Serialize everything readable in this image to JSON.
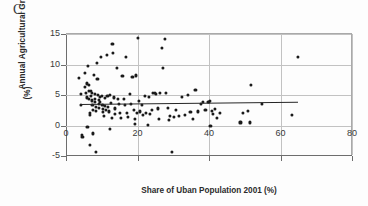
{
  "figure": {
    "panel_label": "C",
    "background_color": "#fdfdfd",
    "point_color": "#1a1a1a",
    "gridline_color": "#c2c2c2",
    "axis_color": "#6d6d6d",
    "trendline_color": "#262626"
  },
  "chart_data": {
    "type": "scatter",
    "title": "C",
    "xlabel": "Share of Uban Population 2001 (%)",
    "ylabel": "Annual Agricultural Growth (%)",
    "ylabel_line1": "Annual Agricultural Growth",
    "ylabel_line2": "(%)",
    "xlim": [
      0,
      80
    ],
    "ylim": [
      -5,
      15
    ],
    "xticks": [
      0,
      20,
      40,
      60,
      80
    ],
    "yticks": [
      -5,
      0,
      5,
      10,
      15
    ],
    "xtick_labels": [
      "0",
      "20",
      "40",
      "60",
      "80"
    ],
    "ytick_labels": [
      "-5",
      "0",
      "5",
      "10",
      "15"
    ],
    "grid": true,
    "grid_axis": "both",
    "legend": false,
    "legend_position": "none",
    "series": [
      {
        "name": "Countries",
        "marker": "circle",
        "color": "#1a1a1a",
        "points": [
          [
            3.6,
            7.8
          ],
          [
            4.2,
            5.1
          ],
          [
            4.3,
            3.4
          ],
          [
            4.4,
            -1.6
          ],
          [
            4.6,
            -1.9
          ],
          [
            5.2,
            8.6
          ],
          [
            5.4,
            6.3
          ],
          [
            5.6,
            5.4
          ],
          [
            5.8,
            4.6
          ],
          [
            5.9,
            6.9
          ],
          [
            6.0,
            -0.2
          ],
          [
            6.1,
            9.8
          ],
          [
            6.3,
            5.7
          ],
          [
            6.4,
            6.7
          ],
          [
            6.5,
            4.3
          ],
          [
            6.6,
            2.0
          ],
          [
            6.7,
            1.8
          ],
          [
            6.8,
            -3.2
          ],
          [
            7.0,
            5.6
          ],
          [
            7.1,
            4.9
          ],
          [
            7.2,
            5.3
          ],
          [
            7.3,
            4.1
          ],
          [
            7.4,
            3.3
          ],
          [
            7.5,
            2.6
          ],
          [
            7.6,
            -1.3
          ],
          [
            7.8,
            8.3
          ],
          [
            8.0,
            5.2
          ],
          [
            8.1,
            4.4
          ],
          [
            8.2,
            3.9
          ],
          [
            8.3,
            3.1
          ],
          [
            8.4,
            2.4
          ],
          [
            8.5,
            -4.3
          ],
          [
            8.7,
            10.2
          ],
          [
            8.8,
            7.6
          ],
          [
            9.0,
            5.0
          ],
          [
            9.1,
            4.2
          ],
          [
            9.2,
            3.6
          ],
          [
            9.3,
            2.9
          ],
          [
            9.5,
            4.7
          ],
          [
            9.6,
            3.8
          ],
          [
            9.8,
            11.2
          ],
          [
            10.0,
            4.9
          ],
          [
            10.2,
            3.4
          ],
          [
            10.3,
            2.7
          ],
          [
            10.4,
            2.2
          ],
          [
            10.6,
            1.5
          ],
          [
            10.8,
            4.5
          ],
          [
            11.0,
            3.2
          ],
          [
            11.2,
            2.5
          ],
          [
            11.4,
            11.5
          ],
          [
            11.6,
            4.8
          ],
          [
            11.8,
            3.0
          ],
          [
            12.0,
            2.3
          ],
          [
            12.2,
            -0.5
          ],
          [
            12.4,
            5.0
          ],
          [
            12.6,
            3.7
          ],
          [
            12.8,
            1.2
          ],
          [
            13.0,
            13.3
          ],
          [
            13.2,
            11.9
          ],
          [
            13.4,
            4.6
          ],
          [
            13.6,
            2.8
          ],
          [
            13.8,
            1.9
          ],
          [
            14.2,
            9.4
          ],
          [
            14.5,
            4.3
          ],
          [
            14.8,
            3.5
          ],
          [
            15.0,
            2.1
          ],
          [
            15.4,
            1.3
          ],
          [
            15.8,
            8.1
          ],
          [
            16.2,
            4.4
          ],
          [
            16.5,
            3.3
          ],
          [
            16.8,
            11.3
          ],
          [
            17.0,
            2.0
          ],
          [
            17.4,
            1.4
          ],
          [
            17.8,
            5.1
          ],
          [
            18.2,
            3.6
          ],
          [
            18.6,
            7.9
          ],
          [
            19.0,
            2.6
          ],
          [
            19.2,
            1.0
          ],
          [
            19.4,
            0.3
          ],
          [
            19.6,
            8.2
          ],
          [
            19.8,
            2.1
          ],
          [
            20.0,
            14.3
          ],
          [
            20.4,
            4.0
          ],
          [
            20.8,
            2.3
          ],
          [
            21.2,
            3.4
          ],
          [
            21.6,
            1.7
          ],
          [
            22.0,
            4.9
          ],
          [
            22.4,
            2.0
          ],
          [
            22.8,
            0.1
          ],
          [
            23.2,
            4.7
          ],
          [
            23.6,
            1.9
          ],
          [
            24.0,
            2.6
          ],
          [
            24.4,
            5.3
          ],
          [
            24.8,
            5.4
          ],
          [
            25.2,
            5.2
          ],
          [
            25.6,
            2.8
          ],
          [
            26.0,
            1.1
          ],
          [
            26.4,
            5.4
          ],
          [
            26.8,
            12.7
          ],
          [
            27.2,
            9.4
          ],
          [
            27.6,
            14.2
          ],
          [
            28.0,
            5.3
          ],
          [
            28.4,
            2.9
          ],
          [
            28.8,
            0.9
          ],
          [
            29.2,
            1.5
          ],
          [
            29.6,
            -4.4
          ],
          [
            30.2,
            1.4
          ],
          [
            30.8,
            2.5
          ],
          [
            31.5,
            1.6
          ],
          [
            32.5,
            4.7
          ],
          [
            33.2,
            1.8
          ],
          [
            34.0,
            5.0
          ],
          [
            34.8,
            2.2
          ],
          [
            35.5,
            1.1
          ],
          [
            36.2,
            5.9
          ],
          [
            37.0,
            2.3
          ],
          [
            37.8,
            3.5
          ],
          [
            38.4,
            3.8
          ],
          [
            39.0,
            2.6
          ],
          [
            39.6,
            3.9
          ],
          [
            40.0,
            3.9
          ],
          [
            40.2,
            4.0
          ],
          [
            40.4,
            0.0
          ],
          [
            40.8,
            2.4
          ],
          [
            41.2,
            1.9
          ],
          [
            41.6,
            2.7
          ],
          [
            42.2,
            1.2
          ],
          [
            43.0,
            2.0
          ],
          [
            48.8,
            0.5
          ],
          [
            49.5,
            2.1
          ],
          [
            50.8,
            2.4
          ],
          [
            51.4,
            0.5
          ],
          [
            51.8,
            6.6
          ],
          [
            54.8,
            3.6
          ],
          [
            63.2,
            1.8
          ],
          [
            64.8,
            11.3
          ]
        ]
      }
    ],
    "trendline": {
      "x_start": 4.0,
      "y_start": 3.52,
      "x_end": 65.0,
      "y_end": 3.88,
      "color": "#262626"
    }
  }
}
